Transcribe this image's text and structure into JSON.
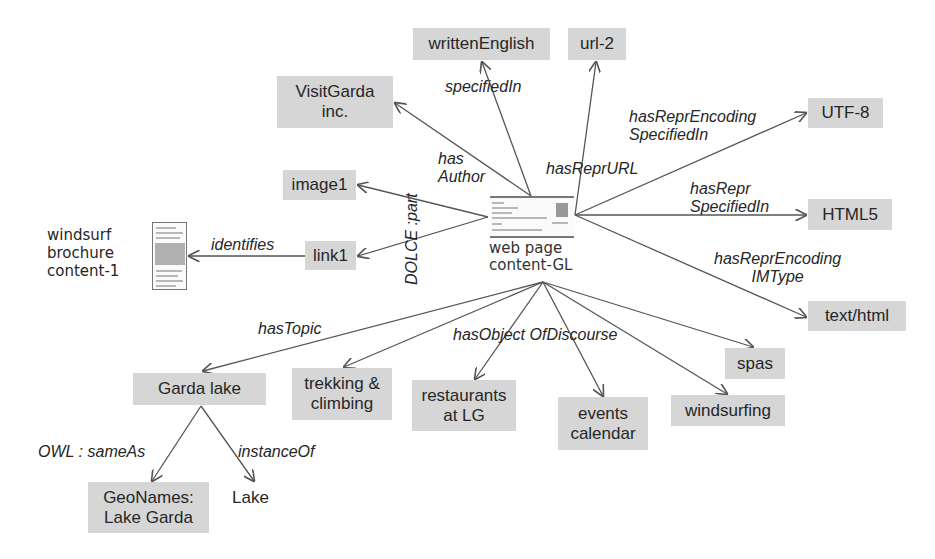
{
  "diagram": {
    "center_node": {
      "label_line1": "web page",
      "label_line2": "content-GL",
      "icon": "web-page-thumbnail-icon"
    },
    "nodes": {
      "written_english": "writtenEnglish",
      "url2": "url-2",
      "visitgarda_line1": "VisitGarda",
      "visitgarda_line2": "inc.",
      "utf8": "UTF-8",
      "image1": "image1",
      "html5": "HTML5",
      "link1": "link1",
      "text_html": "text/html",
      "brochure_line1": "windsurf",
      "brochure_line2": "brochure",
      "brochure_line3": "content-1",
      "garda_lake": "Garda lake",
      "trekking_line1": "trekking &",
      "trekking_line2": "climbing",
      "restaurants_line1": "restaurants",
      "restaurants_line2": "at LG",
      "events_line1": "events",
      "events_line2": "calendar",
      "spas": "spas",
      "windsurfing": "windsurfing",
      "geonames_line1": "GeoNames:",
      "geonames_line2": "Lake Garda",
      "lake": "Lake"
    },
    "edges": {
      "specified_in": "specifiedIn",
      "has_author_line1": "has",
      "has_author_line2": "Author",
      "has_repr_url": "hasReprURL",
      "has_repr_encoding_specified_in_line1": "hasReprEncoding",
      "has_repr_encoding_specified_in_line2": "SpecifiedIn",
      "has_repr_specified_in_line1": "hasRepr",
      "has_repr_specified_in_line2": "SpecifiedIn",
      "has_repr_encoding_imtype_line1": "hasReprEncoding",
      "has_repr_encoding_imtype_line2": "IMType",
      "dolce_part": "DOLCE :part",
      "identifies": "identifies",
      "has_topic": "hasTopic",
      "has_object_of_discourse": "hasObject OfDiscourse",
      "owl_same_as": "OWL : sameAs",
      "instance_of": "instanceOf"
    },
    "colors": {
      "node_fill": "#d6d6d6",
      "edge_stroke": "#555555",
      "text": "#262626"
    }
  }
}
